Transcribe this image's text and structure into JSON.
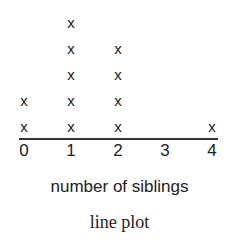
{
  "chart_data": {
    "type": "dot",
    "title": "",
    "caption": "line plot",
    "xlabel": "number of siblings",
    "ylabel": "",
    "categories": [
      "0",
      "1",
      "2",
      "3",
      "4"
    ],
    "values": [
      2,
      5,
      4,
      0,
      1
    ],
    "marker": "x",
    "xlim": [
      0,
      4
    ],
    "grid": false,
    "legend": null
  },
  "labels": {
    "xlabel": "number of siblings",
    "caption": "line plot",
    "ticks": [
      "0",
      "1",
      "2",
      "3",
      "4"
    ],
    "marker": "x"
  }
}
